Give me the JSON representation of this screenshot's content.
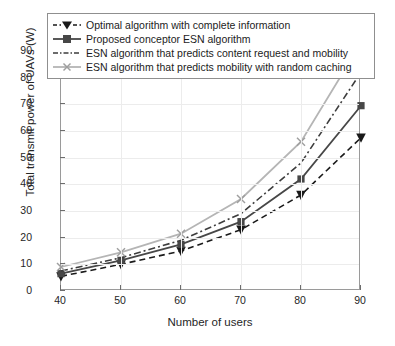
{
  "chart_data": {
    "type": "line",
    "title": "",
    "xlabel": "Number of users",
    "ylabel": "Total transmit power of UAVs (W)",
    "x": [
      40,
      50,
      60,
      70,
      80,
      90
    ],
    "xlim": [
      40,
      90
    ],
    "ylim": [
      0,
      90
    ],
    "xticks": [
      40,
      50,
      60,
      70,
      80,
      90
    ],
    "yticks": [
      0,
      10,
      20,
      30,
      40,
      50,
      60,
      70,
      80,
      90
    ],
    "grid": true,
    "legend_position": "top",
    "series": [
      {
        "name": "Optimal algorithm with complete information",
        "values": [
          5.5,
          10,
          15,
          23,
          36,
          57.5
        ],
        "color": "#1a1a1a",
        "style": "dashed",
        "marker": "triangle-down"
      },
      {
        "name": "Proposed conceptor ESN algorithm",
        "values": [
          6.5,
          11.5,
          17.5,
          26,
          42,
          69.5
        ],
        "color": "#474747",
        "style": "solid",
        "marker": "square"
      },
      {
        "name": "ESN algorithm that predicts content request and mobility",
        "values": [
          7.5,
          12.5,
          19,
          29,
          48,
          82
        ],
        "color": "#3d3d3d",
        "style": "dash-dot",
        "marker": "none"
      },
      {
        "name": "ESN algorithm that predicts mobility with random caching",
        "values": [
          9,
          14.5,
          21.5,
          34.5,
          56,
          93
        ],
        "color": "#b5b5b5",
        "style": "solid",
        "marker": "x"
      }
    ]
  },
  "legend": {
    "items": [
      "Optimal algorithm with complete information",
      "Proposed conceptor ESN algorithm",
      "ESN algorithm that predicts content request and mobility",
      "ESN algorithm that predicts mobility with random caching"
    ]
  },
  "axes": {
    "y_tick_labels": [
      "90",
      "80",
      "70",
      "60",
      "50",
      "40",
      "30",
      "20",
      "10",
      "0"
    ],
    "x_tick_labels": [
      "40",
      "50",
      "60",
      "70",
      "80",
      "90"
    ]
  },
  "colors": {
    "frame": "#9a9a9a",
    "grid": "#ececec",
    "text": "#262626"
  }
}
